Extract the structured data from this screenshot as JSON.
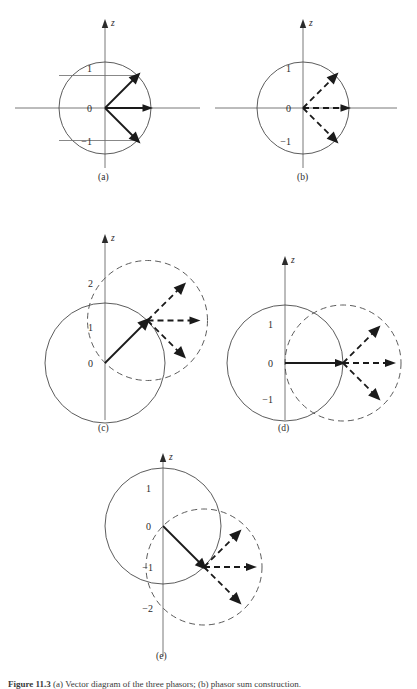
{
  "figure": {
    "caption_prefix": "Figure 11.3",
    "caption_text": "(a) Vector diagram of the three phasors; (b) phasor sum construction.",
    "axis_label": "z",
    "panels": [
      {
        "id": "a",
        "label": "(a)",
        "tick_labels": [
          "1",
          "0",
          "−1"
        ],
        "solid_circle": true,
        "dashed_circle": false,
        "arrow_style": "solid",
        "tick_guides": true,
        "arrow_angles": [
          45,
          0,
          -45
        ],
        "origin_offset": [
          0,
          0
        ]
      },
      {
        "id": "b",
        "label": "(b)",
        "tick_labels": [
          "1",
          "0",
          "−1"
        ],
        "solid_circle": true,
        "dashed_circle": false,
        "arrow_style": "dashed",
        "tick_guides": false,
        "arrow_angles": [
          45,
          0,
          -45
        ],
        "origin_offset": [
          0,
          0
        ]
      },
      {
        "id": "c",
        "label": "(c)",
        "tick_labels": [
          "2",
          "1",
          "0"
        ],
        "solid_circle": true,
        "dashed_circle": true,
        "arrow_style": "dashed",
        "tick_guides": false,
        "arrow_angles": [
          45,
          0,
          -45
        ],
        "carrier_angle": 45
      },
      {
        "id": "d",
        "label": "(d)",
        "tick_labels": [
          "1",
          "0",
          "−1"
        ],
        "solid_circle": true,
        "dashed_circle": true,
        "arrow_style": "dashed",
        "tick_guides": false,
        "arrow_angles": [
          45,
          0,
          -45
        ],
        "carrier_angle": 0
      },
      {
        "id": "e",
        "label": "(e)",
        "tick_labels": [
          "1",
          "0",
          "−1",
          "−2"
        ],
        "solid_circle": true,
        "dashed_circle": true,
        "arrow_style": "dashed",
        "tick_guides": false,
        "arrow_angles": [
          45,
          0,
          -45
        ],
        "carrier_angle": -45
      }
    ]
  },
  "style": {
    "line_color": "#2b2b2b",
    "axis_color": "#5a5a5a",
    "circle_color": "#4a4a4a",
    "background": "#ffffff"
  }
}
